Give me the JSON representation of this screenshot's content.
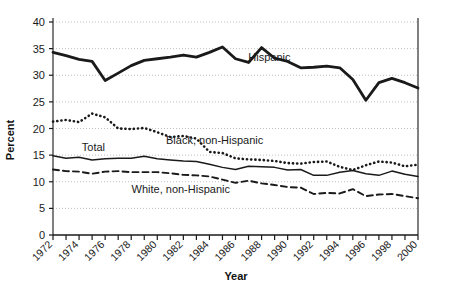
{
  "chart_data": {
    "type": "line",
    "title": "",
    "xlabel": "Year",
    "ylabel": "Percent",
    "xlim": [
      1972,
      2000
    ],
    "ylim": [
      0,
      40
    ],
    "yticks": [
      0,
      5,
      10,
      15,
      20,
      25,
      30,
      35,
      40
    ],
    "ytick_labels": [
      "0",
      "5",
      "10",
      "15",
      "20",
      "25",
      "30",
      "35",
      "40"
    ],
    "xticks": [
      1972,
      1973,
      1974,
      1975,
      1976,
      1977,
      1978,
      1979,
      1980,
      1981,
      1982,
      1983,
      1984,
      1985,
      1986,
      1987,
      1988,
      1989,
      1990,
      1991,
      1992,
      1993,
      1994,
      1995,
      1996,
      1997,
      1998,
      1999,
      2000
    ],
    "xtick_labels": [
      "1972",
      "1974",
      "1976",
      "1978",
      "1980",
      "1982",
      "1984",
      "1986",
      "1988",
      "1990",
      "1992",
      "1994",
      "1996",
      "1998",
      "2000"
    ],
    "xtick_labeled_years": [
      1972,
      1974,
      1976,
      1978,
      1980,
      1982,
      1984,
      1986,
      1988,
      1990,
      1992,
      1994,
      1996,
      1998,
      2000
    ],
    "grid": true,
    "grid_style": "dotted-horizontal",
    "legend": "inline-annotations",
    "x": [
      1972,
      1973,
      1974,
      1975,
      1976,
      1977,
      1978,
      1979,
      1980,
      1981,
      1982,
      1983,
      1984,
      1985,
      1986,
      1987,
      1988,
      1989,
      1990,
      1991,
      1992,
      1993,
      1994,
      1995,
      1996,
      1997,
      1998,
      1999,
      2000
    ],
    "series": [
      {
        "name": "Hispanic",
        "label": "Hispanic",
        "style": "solid-thick",
        "color": "#1a1a1a",
        "label_x": 1988.6,
        "label_y": 32.6,
        "values": [
          34.3,
          33.7,
          33.0,
          32.6,
          29.0,
          30.4,
          31.8,
          32.8,
          33.1,
          33.4,
          33.8,
          33.4,
          34.3,
          35.3,
          33.1,
          32.4,
          35.2,
          33.2,
          32.6,
          31.4,
          31.5,
          31.7,
          31.4,
          29.2,
          25.3,
          28.6,
          29.4,
          28.6,
          27.6
        ]
      },
      {
        "name": "Black, non-Hispanic",
        "label": "Black, non-Hispanic",
        "style": "dotted",
        "color": "#1a1a1a",
        "label_x": 1984.4,
        "label_y": 17.0,
        "values": [
          21.3,
          21.6,
          21.2,
          22.8,
          22.1,
          20.0,
          19.9,
          20.1,
          19.3,
          18.4,
          18.6,
          18.1,
          15.6,
          15.4,
          14.4,
          14.2,
          14.1,
          13.9,
          13.5,
          13.4,
          13.7,
          13.8,
          12.8,
          12.2,
          13.1,
          13.8,
          13.6,
          12.9,
          13.2
        ]
      },
      {
        "name": "Total",
        "label": "Total",
        "style": "solid-thin",
        "color": "#1a1a1a",
        "label_x": 1975.1,
        "label_y": 15.8,
        "values": [
          14.9,
          14.4,
          14.6,
          14.1,
          14.3,
          14.4,
          14.4,
          14.8,
          14.3,
          14.1,
          13.9,
          13.8,
          13.3,
          12.7,
          12.3,
          12.9,
          12.8,
          12.7,
          12.2,
          12.3,
          11.2,
          11.2,
          11.8,
          12.1,
          11.5,
          11.2,
          12.0,
          11.4,
          11.0
        ]
      },
      {
        "name": "White, non-Hispanic",
        "label": "White, non-Hispanic",
        "style": "dashed",
        "color": "#1a1a1a",
        "label_x": 1981.8,
        "label_y": 7.9,
        "values": [
          12.3,
          12.0,
          11.9,
          11.5,
          11.9,
          12.0,
          11.8,
          11.8,
          11.8,
          11.6,
          11.3,
          11.2,
          11.0,
          10.4,
          9.8,
          10.2,
          9.7,
          9.4,
          9.0,
          8.9,
          7.7,
          7.9,
          7.8,
          8.6,
          7.3,
          7.6,
          7.7,
          7.3,
          6.9
        ]
      }
    ]
  }
}
